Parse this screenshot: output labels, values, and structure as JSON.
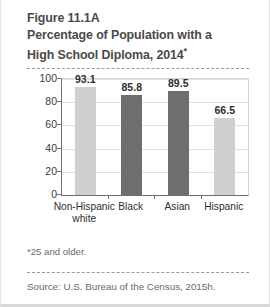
{
  "figure": {
    "title_lines": [
      "Figure 11.1A",
      "Percentage of Population with a",
      "High School Diploma, 2014"
    ],
    "title_asterisk": "*",
    "footnote": "*25 and older.",
    "source": "Source: U.S. Bureau of the Census, 2015h."
  },
  "colors": {
    "bar_light": "#cfcfcf",
    "bar_dark": "#6e6e6e",
    "axis": "#6f6f6f",
    "grid": "#e2e2e2",
    "title_text": "#4a4a4a",
    "body_text": "#2e2e2e",
    "muted_text": "#6a6a6a"
  },
  "chart_data": {
    "type": "bar",
    "title": "Percentage of Population with a High School Diploma, 2014",
    "xlabel": "",
    "ylabel": "",
    "ylim": [
      0,
      100
    ],
    "yticks": [
      0,
      20,
      40,
      60,
      80,
      100
    ],
    "ytick_labels": [
      "0",
      "20",
      "40",
      "60",
      "80",
      "100"
    ],
    "grid": true,
    "legend": "none",
    "categories": [
      "Non-Hispanic white",
      "Black",
      "Asian",
      "Hispanic"
    ],
    "category_label_lines": [
      [
        "Non-Hispanic",
        "white"
      ],
      [
        "Black"
      ],
      [
        "Asian"
      ],
      [
        "Hispanic"
      ]
    ],
    "values": [
      93.1,
      85.8,
      89.5,
      66.5
    ],
    "value_labels": [
      "93.1",
      "85.8",
      "89.5",
      "66.5"
    ],
    "bar_colors": [
      "#cfcfcf",
      "#6e6e6e",
      "#6e6e6e",
      "#cfcfcf"
    ]
  }
}
